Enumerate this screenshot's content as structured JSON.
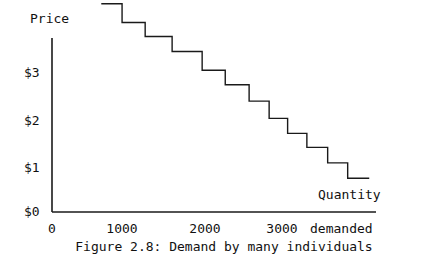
{
  "figure": {
    "caption": "Figure 2.8: Demand by many individuals",
    "price_axis_title": "Price",
    "quantity_axis_title": "Quantity",
    "quantity_axis_title_line2": "demanded"
  },
  "axes": {
    "y_ticks": [
      {
        "label": "$0",
        "value": 0
      },
      {
        "label": "$1",
        "value": 1
      },
      {
        "label": "$2",
        "value": 2
      },
      {
        "label": "$3",
        "value": 3
      }
    ],
    "x_ticks": [
      {
        "label": "0",
        "value": 0
      },
      {
        "label": "1000",
        "value": 1000
      },
      {
        "label": "2000",
        "value": 2000
      },
      {
        "label": "3000",
        "value": 3000
      }
    ]
  },
  "style": {
    "line_color": "#1a1a1a",
    "axis_color": "#1a1a1a",
    "background": "#ffffff",
    "line_width": 1.4
  },
  "chart_data": {
    "type": "line",
    "title": "Figure 2.8: Demand by many individuals",
    "xlabel": "Quantity demanded",
    "ylabel": "Price",
    "xlim": [
      0,
      4200
    ],
    "ylim": [
      0,
      4.8
    ],
    "grid": false,
    "legend": null,
    "subtype": "step-demand-curve",
    "note": "Descending staircase demand curve; each tread is one price step.",
    "steps": [
      {
        "q_start": 640,
        "q_end": 910,
        "price": 4.45
      },
      {
        "q_start": 910,
        "q_end": 1210,
        "price": 4.05
      },
      {
        "q_start": 1210,
        "q_end": 1560,
        "price": 3.75
      },
      {
        "q_start": 1560,
        "q_end": 1950,
        "price": 3.43
      },
      {
        "q_start": 1950,
        "q_end": 2250,
        "price": 3.03
      },
      {
        "q_start": 2250,
        "q_end": 2560,
        "price": 2.72
      },
      {
        "q_start": 2560,
        "q_end": 2820,
        "price": 2.37
      },
      {
        "q_start": 2820,
        "q_end": 3060,
        "price": 2.0
      },
      {
        "q_start": 3060,
        "q_end": 3310,
        "price": 1.68
      },
      {
        "q_start": 3310,
        "q_end": 3580,
        "price": 1.38
      },
      {
        "q_start": 3580,
        "q_end": 3840,
        "price": 1.05
      },
      {
        "q_start": 3840,
        "q_end": 4120,
        "price": 0.72
      }
    ],
    "x": [
      640,
      910,
      910,
      1210,
      1210,
      1560,
      1560,
      1950,
      1950,
      2250,
      2250,
      2560,
      2560,
      2820,
      2820,
      3060,
      3060,
      3310,
      3310,
      3580,
      3580,
      3840,
      3840,
      4120
    ],
    "y": [
      4.45,
      4.45,
      4.05,
      4.05,
      3.75,
      3.75,
      3.43,
      3.43,
      3.03,
      3.03,
      2.72,
      2.72,
      2.37,
      2.37,
      2.0,
      2.0,
      1.68,
      1.68,
      1.38,
      1.38,
      1.05,
      1.05,
      0.72,
      0.72
    ]
  }
}
